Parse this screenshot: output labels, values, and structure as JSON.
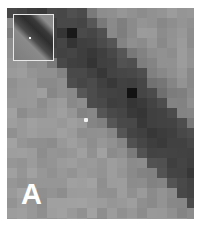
{
  "figure": {
    "panel_label": "A",
    "colors": {
      "background_light": "#8a8a8a",
      "band_dark": "#2a2a2a",
      "highlight_dot": "#f2f2f2",
      "inset_border": "#e8e8e8"
    },
    "inset": {
      "position": "top-left",
      "has_marker_dot": true
    },
    "marker": {
      "x": 86,
      "y": 120
    }
  }
}
